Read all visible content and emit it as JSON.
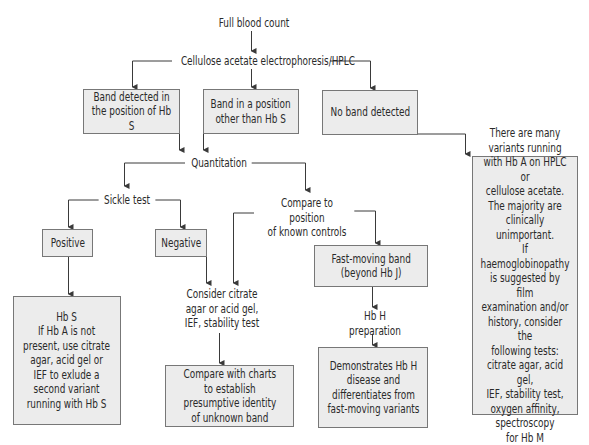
{
  "diagram": {
    "type": "flowchart",
    "colors": {
      "box_fill": "#ececec",
      "box_border": "#777777",
      "line": "#3a3a3a",
      "text": "#2a2a2a",
      "background": "#ffffff"
    },
    "nodes": {
      "full_blood_count": "Full blood count",
      "electrophoresis": "Cellulose acetate electrophoresis/HPLC",
      "band_hbs": "Band detected in\nthe position of Hb S",
      "band_other": "Band in a position\nother than Hb S",
      "no_band": "No band detected",
      "quantitation": "Quantitation",
      "sickle_test": "Sickle test",
      "compare_controls": "Compare to position\nof known controls",
      "positive": "Positive",
      "negative": "Negative",
      "fast_moving": "Fast-moving band\n(beyond Hb J)",
      "hbs_result": "Hb S\nIf Hb A is not\npresent, use citrate\nagar, acid gel or\nIEF to exlude a\nsecond variant\nrunning with Hb S",
      "consider_citrate": "Consider citrate\nagar or acid gel,\nIEF, stability test",
      "compare_charts": "Compare with charts\nto establish\npresumptive identity\nof unknown band",
      "hbh_prep": "Hb H\npreparation",
      "demonstrates_hbh": "Demonstrates Hb H\ndisease and\ndifferentiates from\nfast-moving variants",
      "many_variants": "There are many\nvariants running\nwith Hb A on HPLC or\ncellulose acetate.\nThe majority are\nclinically unimportant.\nIf haemoglobinopathy\nis suggested by film\nexamination and/or\nhistory, consider the\nfollowing tests:\ncitrate agar, acid gel,\nIEF, stability test,\noxygen affinity,\nspectroscopy\nfor Hb M"
    },
    "edges": [
      {
        "from": "full_blood_count",
        "to": "electrophoresis"
      },
      {
        "from": "electrophoresis",
        "to": "band_hbs"
      },
      {
        "from": "electrophoresis",
        "to": "band_other"
      },
      {
        "from": "electrophoresis",
        "to": "no_band"
      },
      {
        "from": "band_hbs",
        "to": "quantitation"
      },
      {
        "from": "band_other",
        "to": "quantitation"
      },
      {
        "from": "no_band",
        "to": "many_variants"
      },
      {
        "from": "quantitation",
        "to": "sickle_test"
      },
      {
        "from": "quantitation",
        "to": "compare_controls"
      },
      {
        "from": "sickle_test",
        "to": "positive"
      },
      {
        "from": "sickle_test",
        "to": "negative"
      },
      {
        "from": "compare_controls",
        "to": "consider_citrate"
      },
      {
        "from": "compare_controls",
        "to": "fast_moving"
      },
      {
        "from": "positive",
        "to": "hbs_result"
      },
      {
        "from": "negative",
        "to": "consider_citrate"
      },
      {
        "from": "consider_citrate",
        "to": "compare_charts"
      },
      {
        "from": "fast_moving",
        "to": "hbh_prep"
      },
      {
        "from": "hbh_prep",
        "to": "demonstrates_hbh"
      }
    ]
  }
}
